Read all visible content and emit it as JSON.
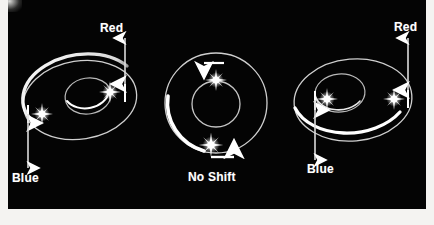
{
  "figure": {
    "kind": "astronomy-diagram",
    "background_color": "#040404",
    "ink_color": "#ffffff",
    "page_color": "#f4f3f1"
  },
  "panels": [
    {
      "id": "left",
      "name": "inclined-orbit-left",
      "orbit_type": "ellipse",
      "labels": [
        {
          "id": "red",
          "text": "Red",
          "position": "top-right"
        },
        {
          "id": "blue",
          "text": "Blue",
          "position": "bottom-left"
        }
      ],
      "stars": [
        {
          "id": "left-star",
          "motion_arrow": "down",
          "shift": "Blue"
        },
        {
          "id": "right-star",
          "motion_arrow": "up",
          "shift": "Red"
        }
      ]
    },
    {
      "id": "middle",
      "name": "face-on-orbit-middle",
      "orbit_type": "circle",
      "labels": [
        {
          "id": "noshift",
          "text": "No Shift",
          "position": "bottom-center"
        }
      ],
      "stars": [
        {
          "id": "top-star",
          "motion_arrow": "left",
          "shift": "No Shift"
        },
        {
          "id": "bottom-star",
          "motion_arrow": "right",
          "shift": "No Shift"
        }
      ]
    },
    {
      "id": "right",
      "name": "inclined-orbit-right",
      "orbit_type": "ellipse",
      "labels": [
        {
          "id": "red",
          "text": "Red",
          "position": "top-right"
        },
        {
          "id": "blue",
          "text": "Blue",
          "position": "bottom-left"
        }
      ],
      "stars": [
        {
          "id": "left-star",
          "motion_arrow": "down",
          "shift": "Blue"
        },
        {
          "id": "right-star",
          "motion_arrow": "up",
          "shift": "Red"
        }
      ]
    }
  ],
  "labels": {
    "left_red": "Red",
    "left_blue": "Blue",
    "middle_noshift": "No Shift",
    "right_red": "Red",
    "right_blue": "Blue"
  }
}
